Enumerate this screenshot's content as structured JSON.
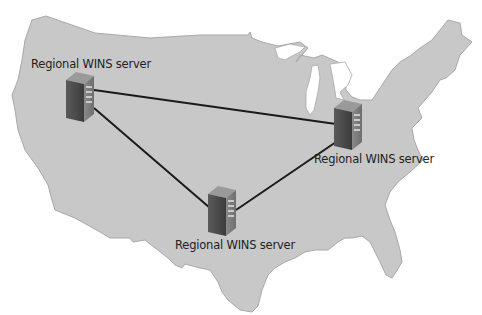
{
  "diagram": {
    "title": "",
    "map_region": "United States",
    "colors": {
      "land": "#c8c8c8",
      "land_outline": "#a8a8a8",
      "link": "#1a1a1a",
      "background": "#ffffff"
    },
    "nodes": [
      {
        "id": "west",
        "label": "Regional WINS server",
        "icon": "server-icon"
      },
      {
        "id": "east",
        "label": "Regional WINS server",
        "icon": "server-icon"
      },
      {
        "id": "south",
        "label": "Regional WINS server",
        "icon": "server-icon"
      }
    ],
    "links": [
      {
        "from": "west",
        "to": "east"
      },
      {
        "from": "west",
        "to": "south"
      },
      {
        "from": "south",
        "to": "east"
      }
    ]
  }
}
